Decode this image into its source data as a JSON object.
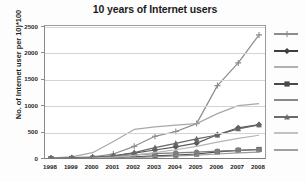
{
  "chart_data": {
    "type": "line",
    "title": "10 years of Internet users",
    "xlabel": "",
    "ylabel": "No. of Internet user per 10)*100",
    "categories": [
      "1998",
      "1999",
      "2000",
      "2001",
      "2002",
      "2003",
      "2004",
      "2005",
      "2006",
      "2007",
      "2008"
    ],
    "ylim": [
      0,
      2500
    ],
    "ytick_labels": [
      "0",
      "500",
      "1000",
      "1500",
      "2000",
      "2500"
    ],
    "ytick_values": [
      0,
      500,
      1000,
      1500,
      2000,
      2500
    ],
    "grid": true,
    "legend_position": "right",
    "legend_labels_visible": false,
    "series": [
      {
        "name": "series-1",
        "color": "#8c8c8c",
        "marker": "plus",
        "values": [
          20,
          25,
          40,
          95,
          240,
          430,
          520,
          670,
          1390,
          1820,
          2350
        ]
      },
      {
        "name": "series-2",
        "color": "#5a5a5a",
        "marker": "diamond",
        "values": [
          15,
          20,
          30,
          60,
          110,
          170,
          230,
          300,
          460,
          590,
          650
        ]
      },
      {
        "name": "series-3",
        "color": "#a8a8a8",
        "marker": "none",
        "values": [
          20,
          40,
          120,
          330,
          560,
          610,
          640,
          670,
          860,
          1010,
          1050
        ]
      },
      {
        "name": "series-4",
        "color": "#4a4a4a",
        "marker": "square",
        "values": [
          8,
          10,
          14,
          22,
          40,
          58,
          75,
          95,
          135,
          165,
          180
        ]
      },
      {
        "name": "series-5",
        "color": "#7d7d7d",
        "marker": "circle",
        "values": [
          10,
          12,
          20,
          45,
          80,
          100,
          115,
          130,
          150,
          165,
          175
        ]
      },
      {
        "name": "series-6",
        "color": "#666666",
        "marker": "triangle",
        "values": [
          12,
          15,
          25,
          55,
          120,
          215,
          295,
          380,
          455,
          570,
          645
        ]
      },
      {
        "name": "series-7",
        "color": "#b5b5b5",
        "marker": "none",
        "values": [
          5,
          8,
          15,
          35,
          70,
          120,
          175,
          240,
          320,
          390,
          450
        ]
      },
      {
        "name": "series-8",
        "color": "#9b9b9b",
        "marker": "none",
        "values": [
          4,
          5,
          8,
          15,
          28,
          42,
          58,
          72,
          95,
          115,
          130
        ]
      }
    ]
  },
  "legend": {
    "rows": [
      {
        "swatch_color": "#8c8c8c",
        "marker": "plus",
        "label": ""
      },
      {
        "swatch_color": "#3f3f3f",
        "marker": "diamond",
        "label": ""
      },
      {
        "swatch_color": "#b0b0b0",
        "marker": "none",
        "label": ""
      },
      {
        "swatch_color": "#4a4a4a",
        "marker": "square",
        "label": ""
      },
      {
        "swatch_color": "#8a8a8a",
        "marker": "none",
        "label": ""
      },
      {
        "swatch_color": "#6b6b6b",
        "marker": "triangle",
        "label": ""
      },
      {
        "swatch_color": "#c2c2c2",
        "marker": "none",
        "label": ""
      },
      {
        "swatch_color": "#a0a0a0",
        "marker": "none",
        "label": ""
      }
    ]
  }
}
